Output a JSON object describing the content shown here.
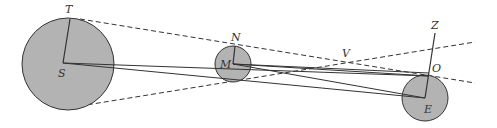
{
  "diagram": {
    "labels": {
      "T": "T",
      "S": "S",
      "N": "N",
      "M": "M",
      "V": "V",
      "Z": "Z",
      "O": "O",
      "E": "E"
    },
    "bodies": [
      {
        "name": "Sun",
        "label": "S",
        "cx": 68,
        "cy": 64,
        "r": 46
      },
      {
        "name": "Moon",
        "label": "M",
        "cx": 233,
        "cy": 64,
        "r": 18
      },
      {
        "name": "Earth",
        "label": "E",
        "cx": 425,
        "cy": 98,
        "r": 23
      }
    ],
    "colors": {
      "fill": "#b3b3b3",
      "stroke": "#333333",
      "background": "#ffffff"
    }
  }
}
